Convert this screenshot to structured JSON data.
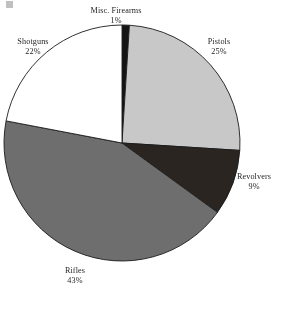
{
  "page": {
    "background_color": "#ffffff",
    "width": 282,
    "height": 309
  },
  "chart_data": {
    "type": "pie",
    "title": "",
    "subtitle": "",
    "xlabel": "",
    "ylabel": "",
    "legend_position": "none",
    "grid": false,
    "labels_outside": true,
    "start_angle_deg": 0,
    "direction": "clockwise",
    "categories": [
      "Misc. Firearms",
      "Pistols",
      "Revolvers",
      "Rifles",
      "Shotguns"
    ],
    "values": [
      1,
      25,
      9,
      43,
      22
    ],
    "value_suffix": "%",
    "slices": [
      {
        "label": "Misc. Firearms",
        "value": 1,
        "value_text": "1%",
        "color": "#141414",
        "start_deg": 0,
        "end_deg": 3.6
      },
      {
        "label": "Pistols",
        "value": 25,
        "value_text": "25%",
        "color": "#c8c8c8",
        "start_deg": 3.6,
        "end_deg": 93.6
      },
      {
        "label": "Revolvers",
        "value": 9,
        "value_text": "9%",
        "color": "#2a2520",
        "start_deg": 93.6,
        "end_deg": 126.0
      },
      {
        "label": "Rifles",
        "value": 43,
        "value_text": "43%",
        "color": "#6e6e6e",
        "start_deg": 126.0,
        "end_deg": 280.8
      },
      {
        "label": "Shotguns",
        "value": 22,
        "value_text": "22%",
        "color": "#ffffff",
        "start_deg": 280.8,
        "end_deg": 360.0
      }
    ],
    "outline_color": "#1b1b1b",
    "center": {
      "x": 122,
      "y": 143
    },
    "radius": 118
  }
}
